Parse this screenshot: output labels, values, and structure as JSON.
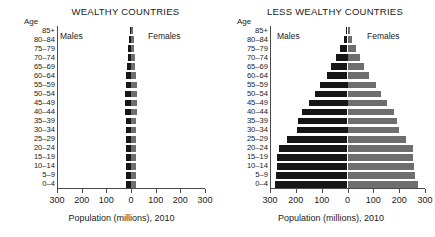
{
  "figure": {
    "axis_caption": "Population (millions), 2010",
    "age_header": "Age",
    "male_label": "Males",
    "female_label": "Females",
    "male_color": "#161616",
    "female_color": "#6e6e6e",
    "axis_color": "#4a4a4a",
    "tick_labels": [
      "300",
      "200",
      "100",
      "0",
      "100",
      "200",
      "300"
    ],
    "tick_values": [
      -300,
      -200,
      -100,
      0,
      100,
      200,
      300
    ]
  },
  "chart_data": [
    {
      "type": "bar",
      "title": "WEALTHY COUNTRIES",
      "subtype": "population-pyramid",
      "xlabel": "Population (millions), 2010",
      "ylabel": "Age",
      "xlim": [
        -300,
        300
      ],
      "xticks": [
        -300,
        -200,
        -100,
        0,
        100,
        200,
        300
      ],
      "xticklabels": [
        "300",
        "200",
        "100",
        "0",
        "100",
        "200",
        "300"
      ],
      "grid": false,
      "legend": [
        "Males",
        "Females"
      ],
      "legend_position": "inside-top",
      "categories": [
        "85+",
        "80–84",
        "75–79",
        "70–74",
        "65–69",
        "60–64",
        "55–59",
        "50–54",
        "45–49",
        "40–44",
        "35–39",
        "30–34",
        "25–29",
        "20–24",
        "15–19",
        "10–14",
        "5–9",
        "0–4"
      ],
      "series": [
        {
          "name": "Males",
          "side": "left",
          "values": [
            5,
            8,
            11,
            14,
            16,
            20,
            22,
            23,
            24,
            23,
            22,
            22,
            22,
            22,
            21,
            20,
            20,
            21
          ]
        },
        {
          "name": "Females",
          "side": "right",
          "values": [
            9,
            12,
            14,
            16,
            18,
            21,
            23,
            24,
            24,
            23,
            22,
            22,
            22,
            22,
            20,
            20,
            19,
            20
          ]
        }
      ]
    },
    {
      "type": "bar",
      "title": "LESS WEALTHY COUNTRIES",
      "subtype": "population-pyramid",
      "xlabel": "Population (millions), 2010",
      "ylabel": "Age",
      "xlim": [
        -300,
        300
      ],
      "xticks": [
        -300,
        -200,
        -100,
        0,
        100,
        200,
        300
      ],
      "xticklabels": [
        "300",
        "200",
        "100",
        "0",
        "100",
        "200",
        "300"
      ],
      "grid": false,
      "legend": [
        "Males",
        "Females"
      ],
      "legend_position": "inside-top",
      "categories": [
        "85+",
        "80–84",
        "75–79",
        "70–74",
        "65–69",
        "60–64",
        "55–59",
        "50–54",
        "45–49",
        "40–44",
        "35–39",
        "30–34",
        "25–29",
        "20–24",
        "15–19",
        "10–14",
        "5–9",
        "0–4"
      ],
      "series": [
        {
          "name": "Males",
          "side": "left",
          "values": [
            7,
            14,
            28,
            45,
            62,
            80,
            105,
            125,
            150,
            178,
            190,
            195,
            235,
            265,
            272,
            272,
            278,
            282
          ]
        },
        {
          "name": "Females",
          "side": "right",
          "values": [
            11,
            18,
            33,
            48,
            65,
            85,
            112,
            130,
            152,
            180,
            192,
            200,
            228,
            255,
            255,
            256,
            262,
            272
          ]
        }
      ]
    }
  ]
}
